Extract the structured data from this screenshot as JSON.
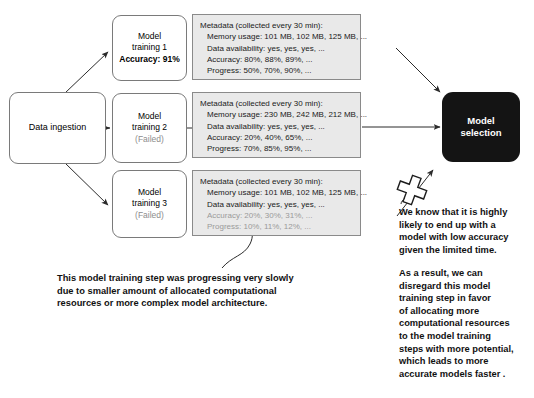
{
  "diagram": {
    "colors": {
      "metadata_fill": "#e9e9e9",
      "selection_fill": "#141414",
      "node_stroke": "#7a7a7a",
      "muted_text": "#8d8d8d",
      "faded_metric": "#9a9a9a"
    }
  },
  "ingestion": {
    "label": "Data ingestion"
  },
  "trainings": [
    {
      "line1": "Model",
      "line2": "training 1",
      "status": "Accuracy: 91%",
      "status_style": "bold"
    },
    {
      "line1": "Model",
      "line2": "training 2",
      "status": "(Failed)",
      "status_style": "muted"
    },
    {
      "line1": "Model",
      "line2": "training 3",
      "status": "(Failed)",
      "status_style": "muted"
    }
  ],
  "metadata_boxes": [
    {
      "header": "Metadata (collected every 30 min):",
      "memory": "Memory usage: 101 MB, 102 MB, 125 MB, ...",
      "availability": "Data availability: yes, yes, yes, ...",
      "accuracy": "Accuracy: 80%, 88%, 89%, ...",
      "progress": "Progress: 50%, 70%, 90%, ...",
      "faded": false
    },
    {
      "header": "Metadata (collected every 30 min):",
      "memory": "Memory usage: 230 MB, 242 MB, 212 MB, ...",
      "availability": "Data availability: yes, yes, yes, ...",
      "accuracy": "Accuracy: 20%, 40%, 65%, ...",
      "progress": "Progress: 70%, 85%, 95%, ...",
      "faded": false
    },
    {
      "header": "Metadata (collected every 30 min):",
      "memory": "Memory usage: 101 MB, 102 MB, 125 MB, ...",
      "availability": "Data availability: yes, yes, yes, ...",
      "accuracy": "Accuracy: 20%, 30%, 31%, ...",
      "progress": "Progress: 10%, 11%, 12%, ...",
      "faded": true
    }
  ],
  "selection": {
    "line1": "Model",
    "line2": "selection"
  },
  "annotations": {
    "left": [
      "This model training step was progressing very slowly",
      "due to smaller amount of allocated computational",
      "resources or more complex model architecture."
    ],
    "right_top": [
      "We know that it is highly",
      "likely to end up with a",
      "model with low accuracy",
      "given the limited time."
    ],
    "right_bottom": [
      "As a result, we can",
      "disregard this model",
      "training step in favor",
      "of allocating more",
      "computational resources",
      "to the model training",
      "steps with more potential,",
      "which leads to more",
      "accurate models faster ."
    ]
  },
  "markers": {
    "reject_mark": "x-cross-mark"
  }
}
